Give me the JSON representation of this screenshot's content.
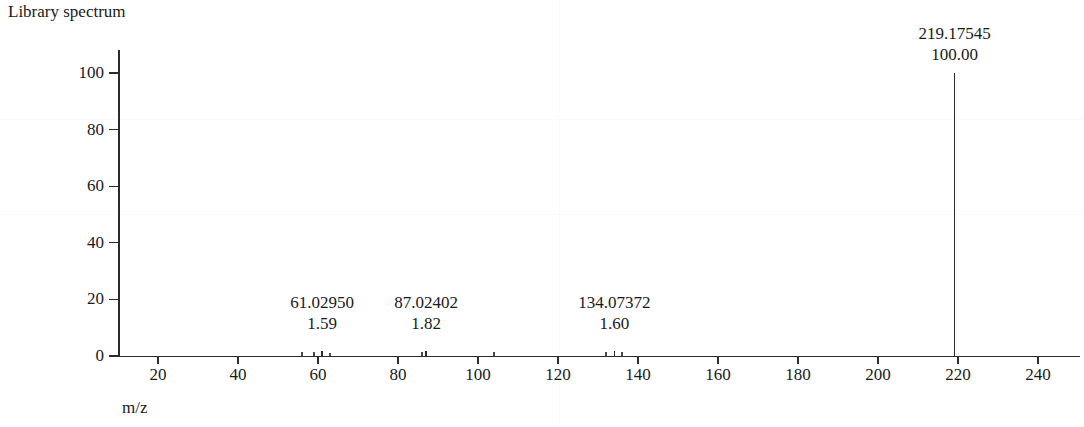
{
  "chart_data": {
    "type": "bar",
    "title": "Library spectrum",
    "xlabel": "m/z",
    "ylabel": "Abundance",
    "xlim": [
      12,
      250
    ],
    "ylim": [
      0,
      108
    ],
    "grid": false,
    "legend": null,
    "xticks": [
      {
        "value": 20,
        "label": "20"
      },
      {
        "value": 40,
        "label": "40"
      },
      {
        "value": 60,
        "label": "60"
      },
      {
        "value": 80,
        "label": "80"
      },
      {
        "value": 100,
        "label": "100"
      },
      {
        "value": 120,
        "label": "120"
      },
      {
        "value": 140,
        "label": "140"
      },
      {
        "value": 160,
        "label": "160"
      },
      {
        "value": 180,
        "label": "180"
      },
      {
        "value": 200,
        "label": "200"
      },
      {
        "value": 220,
        "label": "220"
      },
      {
        "value": 240,
        "label": "240"
      }
    ],
    "yticks": [
      {
        "value": 0,
        "label": "0"
      },
      {
        "value": 20,
        "label": "20"
      },
      {
        "value": 40,
        "label": "40"
      },
      {
        "value": 60,
        "label": "60"
      },
      {
        "value": 80,
        "label": "80"
      },
      {
        "value": 100,
        "label": "100"
      }
    ],
    "peaks": [
      {
        "mz": 61.0295,
        "intensity": 1.59,
        "mz_label": "61.02950",
        "intensity_label": "1.59",
        "labeled": true
      },
      {
        "mz": 87.02402,
        "intensity": 1.82,
        "mz_label": "87.02402",
        "intensity_label": "1.82",
        "labeled": true
      },
      {
        "mz": 134.07372,
        "intensity": 1.6,
        "mz_label": "134.07372",
        "intensity_label": "1.60",
        "labeled": true
      },
      {
        "mz": 219.17545,
        "intensity": 100.0,
        "mz_label": "219.17545",
        "intensity_label": "100.00",
        "labeled": true
      }
    ],
    "minor_peaks": [
      {
        "mz": 56.0,
        "intensity": 0.8
      },
      {
        "mz": 59.0,
        "intensity": 0.9
      },
      {
        "mz": 63.0,
        "intensity": 0.7
      },
      {
        "mz": 86.0,
        "intensity": 0.8
      },
      {
        "mz": 104.0,
        "intensity": 0.8
      },
      {
        "mz": 132.0,
        "intensity": 0.9
      },
      {
        "mz": 136.0,
        "intensity": 0.8
      }
    ],
    "colors": {
      "axis": "#2b2b2b",
      "peak": "#2b2b2b",
      "text": "#1a1a1a",
      "background": "#ffffff"
    }
  }
}
